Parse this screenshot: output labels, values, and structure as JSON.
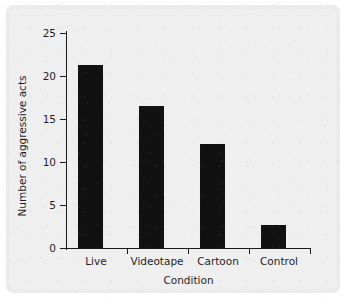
{
  "chart_data": {
    "type": "bar",
    "title": "",
    "xlabel": "Condition",
    "ylabel": "Number of aggressive acts",
    "categories": [
      "Live",
      "Videotape",
      "Cartoon",
      "Control"
    ],
    "values": [
      21.3,
      16.5,
      12.1,
      2.7
    ],
    "ylim": [
      0,
      25
    ],
    "yticks": [
      0,
      5,
      10,
      15,
      20,
      25
    ],
    "ytick_labels": [
      "0",
      "5",
      "10",
      "15",
      "20",
      "25"
    ],
    "grid": false,
    "legend": null,
    "legend_position": "none",
    "bar_color": "#111111",
    "axis_color": "#1a1a1a",
    "background_color": "#f0efef"
  }
}
